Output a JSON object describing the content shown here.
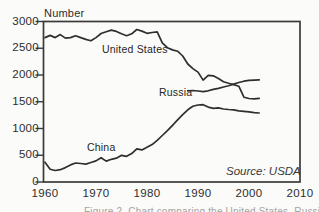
{
  "figure": {
    "y_axis_title": "Number",
    "source_note": "Source: USDA",
    "caption_partial_visible": "Figure 2. Chart comparing the United States, Russia, and China",
    "series_labels": {
      "united_states": "United States",
      "russia": "Russia",
      "china": "China"
    }
  },
  "colors": {
    "line": "#2f2f2f",
    "frame": "#3a3a3a",
    "tick": "#3a3a3a",
    "text": "#2d2d2d",
    "background": "#fbfbf9",
    "caption": "#a3a3a3"
  },
  "chart_data": {
    "type": "line",
    "title": "",
    "xlabel": "",
    "ylabel": "Number",
    "xlim": [
      1960,
      2010
    ],
    "ylim": [
      0,
      3000
    ],
    "x_ticks": [
      1960,
      1970,
      1980,
      1990,
      2000,
      2010
    ],
    "y_ticks": [
      0,
      500,
      1000,
      1500,
      2000,
      2500,
      3000
    ],
    "grid": false,
    "legend_position": "inline-labels",
    "source": "Source: USDA",
    "series": [
      {
        "name": "United States",
        "years": [
          1960,
          1961,
          1962,
          1963,
          1964,
          1965,
          1966,
          1967,
          1968,
          1969,
          1970,
          1971,
          1972,
          1973,
          1974,
          1975,
          1976,
          1977,
          1978,
          1979,
          1980,
          1981,
          1982,
          1983,
          1984,
          1985,
          1986,
          1987,
          1988,
          1989,
          1990,
          1991,
          1992,
          1993,
          1994,
          1995,
          1996,
          1997,
          1998,
          1999,
          2000,
          2001,
          2002
        ],
        "values": [
          2700,
          2740,
          2700,
          2755,
          2690,
          2700,
          2735,
          2700,
          2665,
          2640,
          2700,
          2775,
          2810,
          2840,
          2815,
          2770,
          2735,
          2770,
          2850,
          2820,
          2780,
          2795,
          2805,
          2600,
          2510,
          2470,
          2445,
          2355,
          2205,
          2120,
          2055,
          1905,
          1995,
          1985,
          1935,
          1875,
          1845,
          1820,
          1790,
          1585,
          1560,
          1555,
          1565
        ]
      },
      {
        "name": "Russia",
        "years": [
          1988,
          1989,
          1990,
          1991,
          1992,
          1993,
          1994,
          1995,
          1996,
          1997,
          1998,
          1999,
          2000,
          2001,
          2002
        ],
        "values": [
          1705,
          1710,
          1700,
          1690,
          1705,
          1730,
          1750,
          1775,
          1800,
          1830,
          1860,
          1885,
          1900,
          1905,
          1910
        ]
      },
      {
        "name": "China",
        "years": [
          1960,
          1961,
          1962,
          1963,
          1964,
          1965,
          1966,
          1967,
          1968,
          1969,
          1970,
          1971,
          1972,
          1973,
          1974,
          1975,
          1976,
          1977,
          1978,
          1979,
          1980,
          1981,
          1982,
          1983,
          1984,
          1985,
          1986,
          1987,
          1988,
          1989,
          1990,
          1991,
          1992,
          1993,
          1994,
          1995,
          1996,
          1997,
          1998,
          1999,
          2000,
          2001,
          2002
        ],
        "values": [
          370,
          240,
          215,
          230,
          270,
          320,
          355,
          345,
          335,
          365,
          395,
          455,
          390,
          425,
          445,
          500,
          480,
          530,
          620,
          600,
          650,
          700,
          780,
          870,
          960,
          1060,
          1160,
          1260,
          1350,
          1415,
          1440,
          1445,
          1400,
          1375,
          1385,
          1365,
          1355,
          1350,
          1330,
          1320,
          1310,
          1295,
          1290
        ]
      }
    ]
  }
}
